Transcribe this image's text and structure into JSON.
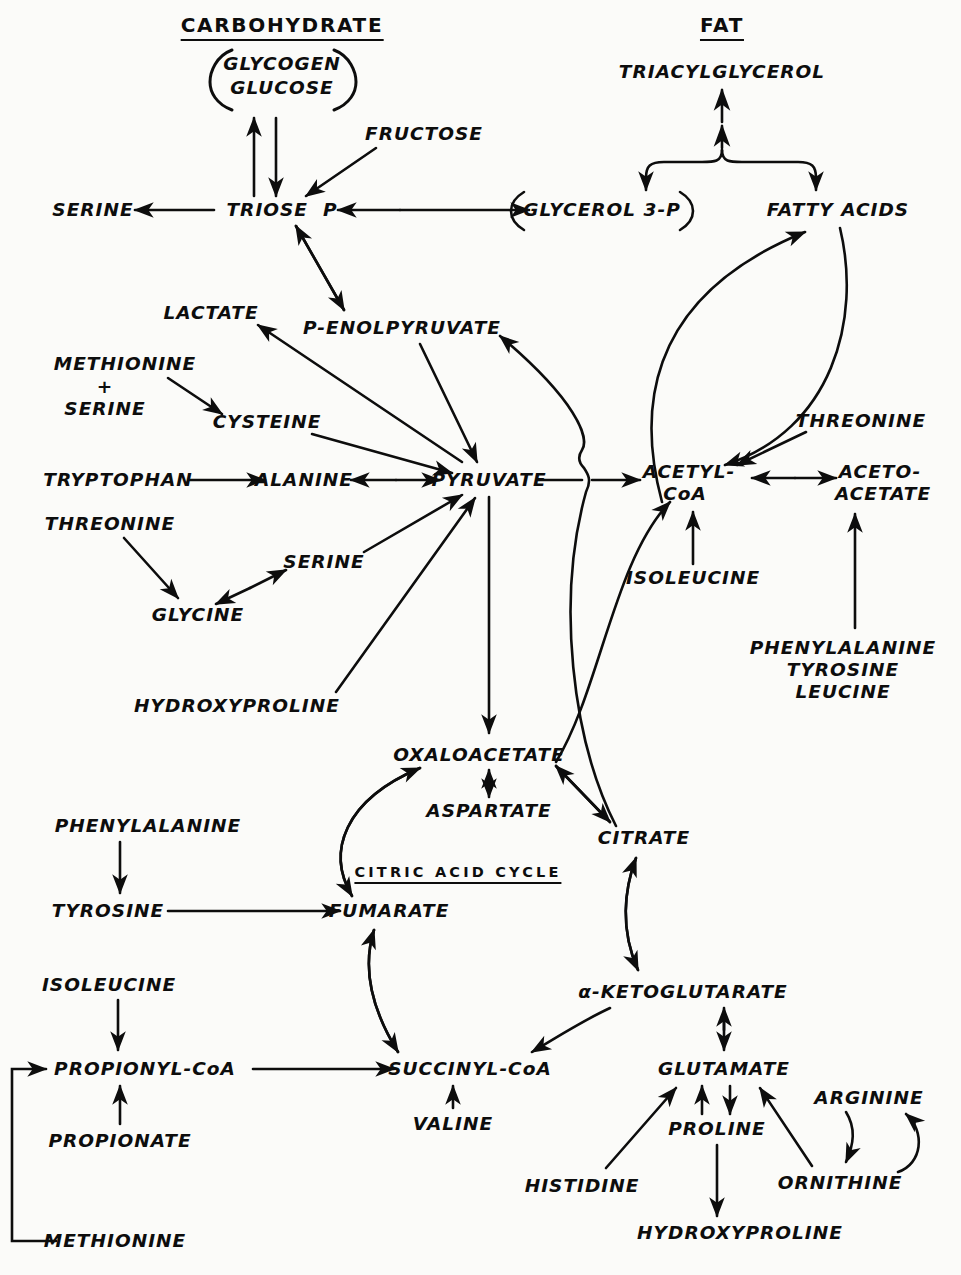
{
  "diagram": {
    "ink_color": "#0d0d0d",
    "background_color": "#fbfbf9",
    "width": 961,
    "height": 1275
  },
  "headings": [
    {
      "id": "carbohydrate",
      "label": "CARBOHYDRATE",
      "x": 282,
      "y": 27
    },
    {
      "id": "fat",
      "label": "FAT",
      "x": 722,
      "y": 27
    },
    {
      "id": "citric-acid-cycle",
      "label": "CITRIC ACID CYCLE",
      "x": 458,
      "y": 874
    }
  ],
  "nodes": [
    {
      "id": "glycogen",
      "label": "GLYCOGEN",
      "x": 282,
      "y": 64,
      "size": "s18"
    },
    {
      "id": "glucose",
      "label": "GLUCOSE",
      "x": 282,
      "y": 88,
      "size": "s18"
    },
    {
      "id": "fructose",
      "label": "FRUCTOSE",
      "x": 424,
      "y": 134,
      "size": "s18"
    },
    {
      "id": "triacylglycerol",
      "label": "TRIACYLGLYCEROL",
      "x": 722,
      "y": 72,
      "size": "s18"
    },
    {
      "id": "serine-top",
      "label": "SERINE",
      "x": 93,
      "y": 210,
      "size": "s18"
    },
    {
      "id": "triose-p",
      "label": "TRIOSE  P",
      "x": 282,
      "y": 210,
      "size": "s18"
    },
    {
      "id": "glycerol-3-p",
      "label": "GLYCEROL 3-P",
      "x": 602,
      "y": 210,
      "size": "s18"
    },
    {
      "id": "fatty-acids",
      "label": "FATTY ACIDS",
      "x": 838,
      "y": 210,
      "size": "s18"
    },
    {
      "id": "lactate",
      "label": "LACTATE",
      "x": 211,
      "y": 313,
      "size": "s18"
    },
    {
      "id": "p-enolpyruvate",
      "label": "P-ENOLPYRUVATE",
      "x": 402,
      "y": 328,
      "size": "s18"
    },
    {
      "id": "methionine-top",
      "label": "METHIONINE",
      "x": 125,
      "y": 364,
      "size": "s18"
    },
    {
      "id": "plus-sign",
      "label": "+",
      "x": 105,
      "y": 387,
      "size": "s18"
    },
    {
      "id": "serine-mid",
      "label": "SERINE",
      "x": 105,
      "y": 409,
      "size": "s18"
    },
    {
      "id": "cysteine",
      "label": "CYSTEINE",
      "x": 267,
      "y": 422,
      "size": "s18"
    },
    {
      "id": "threonine-right",
      "label": "THREONINE",
      "x": 861,
      "y": 421,
      "size": "s18"
    },
    {
      "id": "tryptophan",
      "label": "TRYPTOPHAN",
      "x": 118,
      "y": 480,
      "size": "s18"
    },
    {
      "id": "alanine",
      "label": "ALANINE",
      "x": 304,
      "y": 480,
      "size": "s18"
    },
    {
      "id": "pyruvate",
      "label": "PYRUVATE",
      "x": 489,
      "y": 480,
      "size": "s18"
    },
    {
      "id": "acetyl-coa-1",
      "label": "ACETYL-",
      "x": 689,
      "y": 472,
      "size": "s18"
    },
    {
      "id": "acetyl-coa-2",
      "label": "CoA",
      "x": 685,
      "y": 494,
      "size": "s18"
    },
    {
      "id": "acetoacetate-1",
      "label": "ACETO-",
      "x": 880,
      "y": 472,
      "size": "s18"
    },
    {
      "id": "acetoacetate-2",
      "label": "ACETATE",
      "x": 883,
      "y": 494,
      "size": "s18"
    },
    {
      "id": "threonine-left",
      "label": "THREONINE",
      "x": 110,
      "y": 524,
      "size": "s18"
    },
    {
      "id": "serine-low",
      "label": "SERINE",
      "x": 324,
      "y": 562,
      "size": "s18"
    },
    {
      "id": "isoleucine-acoa",
      "label": "ISOLEUCINE",
      "x": 693,
      "y": 578,
      "size": "s18"
    },
    {
      "id": "glycine",
      "label": "GLYCINE",
      "x": 198,
      "y": 615,
      "size": "s18"
    },
    {
      "id": "phenylalanine-r",
      "label": "PHENYLALANINE",
      "x": 843,
      "y": 648,
      "size": "s18"
    },
    {
      "id": "tyrosine-r",
      "label": "TYROSINE",
      "x": 843,
      "y": 670,
      "size": "s18"
    },
    {
      "id": "leucine-r",
      "label": "LEUCINE",
      "x": 843,
      "y": 692,
      "size": "s18"
    },
    {
      "id": "hydroxyproline-top",
      "label": "HYDROXYPROLINE",
      "x": 237,
      "y": 706,
      "size": "s18"
    },
    {
      "id": "oxaloacetate",
      "label": "OXALOACETATE",
      "x": 479,
      "y": 755,
      "size": "s18"
    },
    {
      "id": "aspartate",
      "label": "ASPARTATE",
      "x": 489,
      "y": 811,
      "size": "s18"
    },
    {
      "id": "citrate",
      "label": "CITRATE",
      "x": 644,
      "y": 838,
      "size": "s18"
    },
    {
      "id": "phenylalanine-l",
      "label": "PHENYLALANINE",
      "x": 148,
      "y": 826,
      "size": "s18"
    },
    {
      "id": "tyrosine-l",
      "label": "TYROSINE",
      "x": 108,
      "y": 911,
      "size": "s18"
    },
    {
      "id": "fumarate",
      "label": "FUMARATE",
      "x": 389,
      "y": 911,
      "size": "s18"
    },
    {
      "id": "isoleucine-l",
      "label": "ISOLEUCINE",
      "x": 109,
      "y": 985,
      "size": "s18"
    },
    {
      "id": "a-ketoglutarate",
      "label": "α-KETOGLUTARATE",
      "x": 683,
      "y": 992,
      "size": "s18"
    },
    {
      "id": "propionyl-coa",
      "label": "PROPIONYL-CoA",
      "x": 145,
      "y": 1069,
      "size": "s18"
    },
    {
      "id": "succinyl-coa",
      "label": "SUCCINYL-CoA",
      "x": 470,
      "y": 1069,
      "size": "s18"
    },
    {
      "id": "glutamate",
      "label": "GLUTAMATE",
      "x": 724,
      "y": 1069,
      "size": "s18"
    },
    {
      "id": "valine",
      "label": "VALINE",
      "x": 453,
      "y": 1124,
      "size": "s18"
    },
    {
      "id": "arginine",
      "label": "ARGININE",
      "x": 869,
      "y": 1098,
      "size": "s18"
    },
    {
      "id": "propionate",
      "label": "PROPIONATE",
      "x": 120,
      "y": 1141,
      "size": "s18"
    },
    {
      "id": "proline",
      "label": "PROLINE",
      "x": 717,
      "y": 1129,
      "size": "s18"
    },
    {
      "id": "histidine",
      "label": "HISTIDINE",
      "x": 582,
      "y": 1186,
      "size": "s18"
    },
    {
      "id": "ornithine",
      "label": "ORNITHINE",
      "x": 840,
      "y": 1183,
      "size": "s18"
    },
    {
      "id": "methionine-bottom",
      "label": "METHIONINE",
      "x": 115,
      "y": 1241,
      "size": "s18"
    },
    {
      "id": "hydroxyproline-bot",
      "label": "HYDROXYPROLINE",
      "x": 740,
      "y": 1233,
      "size": "s18"
    }
  ],
  "brackets": [
    {
      "id": "glycogen-glucose-bracket",
      "note": "parentheses around GLYCOGEN / GLUCOSE"
    },
    {
      "id": "glycerol-3-p-bracket",
      "note": "parentheses around GLYCEROL 3-P"
    }
  ],
  "edges": [
    {
      "from": "triose-p",
      "to": "glycogen",
      "type": "single"
    },
    {
      "from": "glucose",
      "to": "triose-p",
      "type": "single"
    },
    {
      "from": "fructose",
      "to": "triose-p",
      "type": "single"
    },
    {
      "from": "triose-p",
      "to": "serine-top",
      "type": "single"
    },
    {
      "from": "triose-p",
      "to": "glycerol-3-p",
      "type": "double"
    },
    {
      "from": "triacylglycerol",
      "to": "glycerol-3-p",
      "type": "brace"
    },
    {
      "from": "triacylglycerol",
      "to": "fatty-acids",
      "type": "brace"
    },
    {
      "from": "triose-p",
      "to": "p-enolpyruvate",
      "type": "double"
    },
    {
      "from": "p-enolpyruvate",
      "to": "pyruvate",
      "type": "single"
    },
    {
      "from": "pyruvate",
      "to": "lactate",
      "type": "single"
    },
    {
      "from": "methionine-top",
      "to": "cysteine",
      "type": "single"
    },
    {
      "from": "cysteine",
      "to": "pyruvate",
      "type": "single"
    },
    {
      "from": "tryptophan",
      "to": "alanine",
      "type": "single"
    },
    {
      "from": "alanine",
      "to": "pyruvate",
      "type": "double"
    },
    {
      "from": "threonine-left",
      "to": "glycine",
      "type": "single"
    },
    {
      "from": "glycine",
      "to": "serine-low",
      "type": "double"
    },
    {
      "from": "serine-low",
      "to": "pyruvate",
      "type": "single"
    },
    {
      "from": "hydroxyproline-top",
      "to": "pyruvate",
      "type": "single"
    },
    {
      "from": "pyruvate",
      "to": "acetyl-coa-1",
      "type": "single"
    },
    {
      "from": "pyruvate",
      "to": "oxaloacetate",
      "type": "single"
    },
    {
      "from": "acetyl-coa-1",
      "to": "acetoacetate-1",
      "type": "double"
    },
    {
      "from": "isoleucine-acoa",
      "to": "acetyl-coa-2",
      "type": "single"
    },
    {
      "from": "phenylalanine-r",
      "to": "acetoacetate-2",
      "type": "single"
    },
    {
      "from": "threonine-right",
      "to": "acetyl-coa-1",
      "type": "single"
    },
    {
      "from": "acetyl-coa-1",
      "to": "fatty-acids",
      "type": "curve"
    },
    {
      "from": "fatty-acids",
      "to": "acetyl-coa-1",
      "type": "curve"
    },
    {
      "from": "oxaloacetate",
      "to": "aspartate",
      "type": "double"
    },
    {
      "from": "oxaloacetate",
      "to": "citrate",
      "type": "double"
    },
    {
      "from": "oxaloacetate",
      "to": "acetyl-coa-1",
      "type": "curve"
    },
    {
      "from": "citrate",
      "to": "p-enolpyruvate",
      "type": "curve-bridge"
    },
    {
      "from": "citrate",
      "to": "a-ketoglutarate",
      "type": "double-curve"
    },
    {
      "from": "a-ketoglutarate",
      "to": "succinyl-coa",
      "type": "curve"
    },
    {
      "from": "a-ketoglutarate",
      "to": "glutamate",
      "type": "double"
    },
    {
      "from": "succinyl-coa",
      "to": "fumarate",
      "type": "curve"
    },
    {
      "from": "fumarate",
      "to": "oxaloacetate",
      "type": "curve"
    },
    {
      "from": "phenylalanine-l",
      "to": "tyrosine-l",
      "type": "single"
    },
    {
      "from": "tyrosine-l",
      "to": "fumarate",
      "type": "single"
    },
    {
      "from": "isoleucine-l",
      "to": "propionyl-coa",
      "type": "single"
    },
    {
      "from": "propionate",
      "to": "propionyl-coa",
      "type": "single"
    },
    {
      "from": "methionine-bottom",
      "to": "propionyl-coa",
      "type": "elbow"
    },
    {
      "from": "propionyl-coa",
      "to": "succinyl-coa",
      "type": "single"
    },
    {
      "from": "valine",
      "to": "succinyl-coa",
      "type": "single"
    },
    {
      "from": "histidine",
      "to": "glutamate",
      "type": "single"
    },
    {
      "from": "glutamate",
      "to": "proline",
      "type": "single"
    },
    {
      "from": "proline",
      "to": "glutamate",
      "type": "single"
    },
    {
      "from": "proline",
      "to": "hydroxyproline-bot",
      "type": "single"
    },
    {
      "from": "arginine",
      "to": "ornithine",
      "type": "curve"
    },
    {
      "from": "ornithine",
      "to": "arginine",
      "type": "curve"
    },
    {
      "from": "ornithine",
      "to": "glutamate",
      "type": "single"
    }
  ]
}
